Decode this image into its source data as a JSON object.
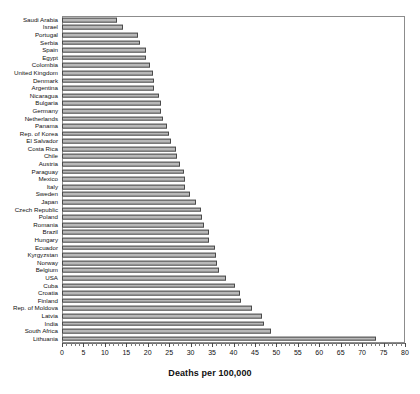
{
  "chart_data": {
    "type": "bar",
    "orientation": "horizontal",
    "title": "",
    "xlabel": "Deaths per 100,000",
    "ylabel": "",
    "xlim": [
      0,
      80
    ],
    "xticks": [
      0,
      5,
      10,
      15,
      20,
      25,
      30,
      35,
      40,
      45,
      50,
      55,
      60,
      65,
      70,
      75,
      80
    ],
    "grid": false,
    "legend": null,
    "bar_fill_color": "#b9b9b9",
    "bar_edge_color": "#4a4a4a",
    "categories": [
      "Saudi Arabia",
      "Israel",
      "Portugal",
      "Serbia",
      "Spain",
      "Egypt",
      "Colombia",
      "United Kingdom",
      "Denmark",
      "Argentina",
      "Nicaragua",
      "Bulgaria",
      "Germany",
      "Netherlands",
      "Panama",
      "Rep. of Korea",
      "El Salvador",
      "Costa Rica",
      "Chile",
      "Austria",
      "Paraguay",
      "Mexico",
      "Italy",
      "Sweden",
      "Japan",
      "Czech Republic",
      "Poland",
      "Romania",
      "Brazil",
      "Hungary",
      "Ecuador",
      "Kyrgyzstan",
      "Norway",
      "Belgium",
      "USA",
      "Cuba",
      "Croatia",
      "Finland",
      "Rep. of Moldova",
      "Latvia",
      "India",
      "South Africa",
      "Lithuania"
    ],
    "values": [
      12.8,
      14.2,
      17.8,
      18.2,
      19.5,
      19.6,
      20.6,
      21.2,
      21.4,
      21.5,
      22.6,
      23.1,
      23.2,
      23.6,
      24.6,
      25.0,
      25.4,
      26.6,
      26.8,
      27.6,
      28.4,
      28.6,
      28.8,
      29.8,
      31.2,
      32.4,
      32.6,
      33.2,
      34.2,
      34.4,
      35.8,
      36.0,
      36.2,
      36.6,
      38.2,
      40.4,
      41.6,
      41.8,
      44.4,
      46.6,
      47.2,
      48.8,
      73.2
    ]
  }
}
